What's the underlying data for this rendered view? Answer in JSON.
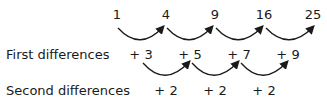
{
  "sequence": [
    "1",
    "4",
    "9",
    "16",
    "25"
  ],
  "first_differences": {
    "label": "First differences",
    "values": [
      "+ 3",
      "+ 5",
      "+ 7",
      "+ 9"
    ]
  },
  "second_differences": {
    "label": "Second differences",
    "values": [
      "+ 2",
      "+ 2",
      "+ 2"
    ]
  }
}
